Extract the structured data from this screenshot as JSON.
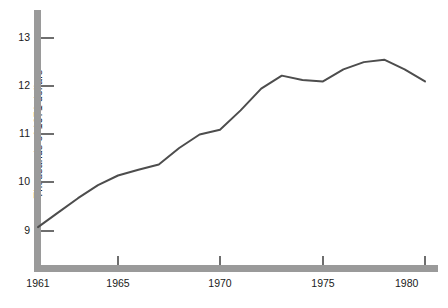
{
  "chart_data": {
    "type": "line",
    "title": "",
    "subtitle": "",
    "xlabel": "",
    "ylabel": "Thousands of 1971 dollars",
    "xlim": [
      1961,
      1980
    ],
    "ylim": [
      8.45,
      13.35
    ],
    "grid": false,
    "legend": null,
    "xticks": [
      1961,
      1965,
      1970,
      1975,
      1980
    ],
    "xtick_labels": [
      "1961",
      "1965",
      "1970",
      "1975",
      "1980"
    ],
    "yticks": [
      9,
      10,
      11,
      12,
      13
    ],
    "ytick_labels": [
      "9",
      "10",
      "11",
      "12",
      "13"
    ],
    "series": [
      {
        "name": "Median family income",
        "x": [
          1961,
          1962,
          1963,
          1964,
          1965,
          1966,
          1967,
          1968,
          1969,
          1970,
          1971,
          1972,
          1973,
          1974,
          1975,
          1976,
          1977,
          1978,
          1979,
          1980
        ],
        "values": [
          9.08,
          9.38,
          9.68,
          9.95,
          10.15,
          10.27,
          10.38,
          10.72,
          11.0,
          11.1,
          11.5,
          11.95,
          12.22,
          12.13,
          12.1,
          12.35,
          12.5,
          12.55,
          12.35,
          12.1
        ]
      }
    ]
  },
  "colors": {
    "axis": "#9a9a9a",
    "line": "#4d4d4d",
    "tick": "#6e6e6e",
    "text": "#1a1a1a",
    "background": "#ffffff"
  }
}
